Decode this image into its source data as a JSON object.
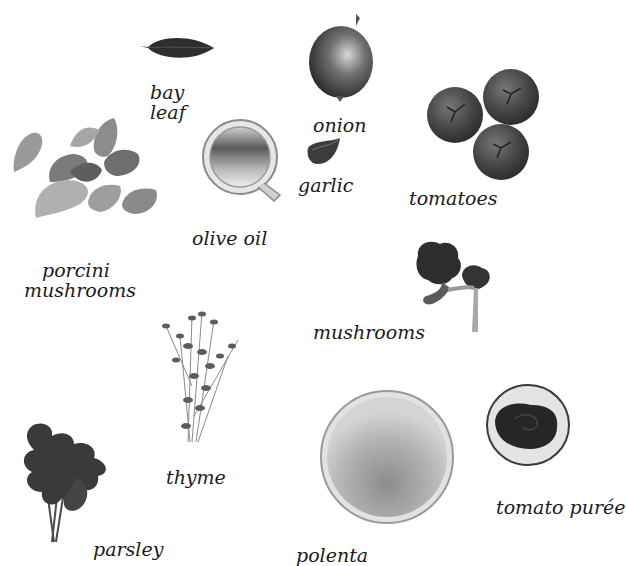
{
  "ingredients": [
    {
      "id": "bay-leaf",
      "label_lines": [
        "bay",
        "leaf"
      ]
    },
    {
      "id": "onion",
      "label": "onion"
    },
    {
      "id": "tomatoes",
      "label": "tomatoes"
    },
    {
      "id": "garlic",
      "label": "garlic"
    },
    {
      "id": "olive-oil",
      "label": "olive oil"
    },
    {
      "id": "porcini-mushrooms",
      "label_lines": [
        "porcini",
        "mushrooms"
      ]
    },
    {
      "id": "mushrooms",
      "label": "mushrooms"
    },
    {
      "id": "thyme",
      "label": "thyme"
    },
    {
      "id": "parsley",
      "label": "parsley"
    },
    {
      "id": "polenta",
      "label": "polenta"
    },
    {
      "id": "tomato-puree",
      "label": "tomato purée"
    }
  ],
  "colors": {
    "background": "#ffffff",
    "text": "#1a1a1a"
  }
}
